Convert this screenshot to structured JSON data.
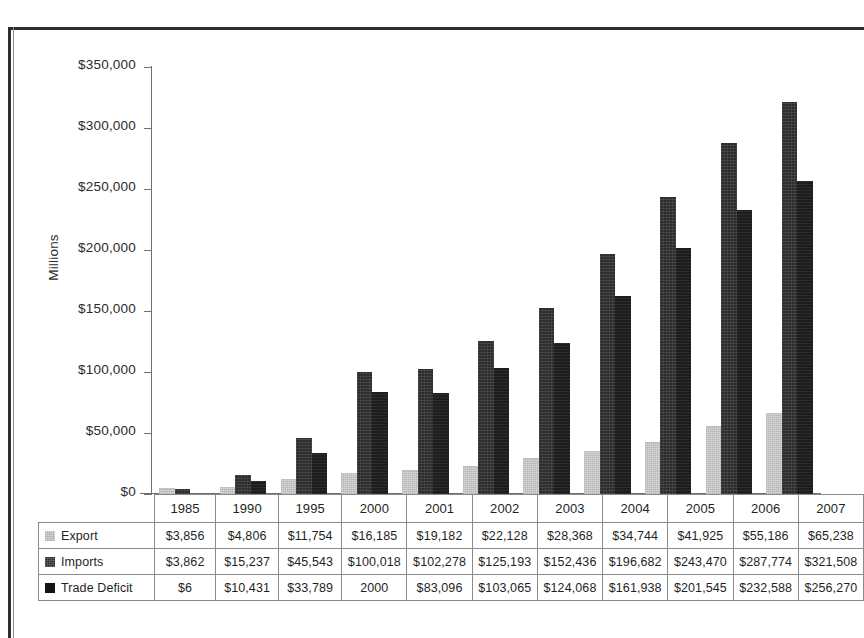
{
  "chart_data": {
    "type": "bar",
    "title": "",
    "xlabel": "",
    "ylabel": "Millions",
    "ylim": [
      0,
      350000
    ],
    "ytick_step": 50000,
    "grid": false,
    "legend_position": "table-left-column",
    "yticks": [
      "$350,000",
      "$300,000",
      "$250,000",
      "$200,000",
      "$150,000",
      "$100,000",
      "$50,000",
      "$0"
    ],
    "ytick_values": [
      350000,
      300000,
      250000,
      200000,
      150000,
      100000,
      50000,
      0
    ],
    "categories": [
      "1985",
      "1990",
      "1995",
      "2000",
      "2001",
      "2002",
      "2003",
      "2004",
      "2005",
      "2006",
      "2007"
    ],
    "series": [
      {
        "name": "Export",
        "color": "#d9d9d9",
        "values": [
          3856,
          4806,
          11754,
          16185,
          19182,
          22128,
          28368,
          34744,
          41925,
          55186,
          65238
        ],
        "labels": [
          "$3,856",
          "$4,806",
          "$11,754",
          "$16,185",
          "$19,182",
          "$22,128",
          "$28,368",
          "$34,744",
          "$41,925",
          "$55,186",
          "$65,238"
        ]
      },
      {
        "name": "Imports",
        "color": "#2c2c2c",
        "values": [
          3862,
          15237,
          45543,
          100018,
          102278,
          125193,
          152436,
          196682,
          243470,
          287774,
          321508
        ],
        "labels": [
          "$3,862",
          "$15,237",
          "$45,543",
          "$100,018",
          "$102,278",
          "$125,193",
          "$152,436",
          "$196,682",
          "$243,470",
          "$287,774",
          "$321,508"
        ]
      },
      {
        "name": "Trade Deficit",
        "color": "#1d1d1d",
        "values": [
          6,
          10431,
          33789,
          83833,
          83096,
          103065,
          124068,
          161938,
          201545,
          232588,
          256270
        ],
        "labels": [
          "$6",
          "$10,431",
          "$33,789",
          "2000",
          "$83,096",
          "$103,065",
          "$124,068",
          "$161,938",
          "$201,545",
          "$232,588",
          "$256,270"
        ]
      }
    ]
  }
}
